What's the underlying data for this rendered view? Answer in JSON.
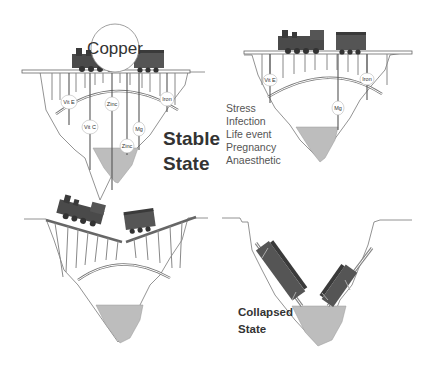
{
  "panels": {
    "stable": {
      "nutrient_bubble": "Copper",
      "pillar_labels": [
        "Vit E",
        "Zinc",
        "Iron",
        "Vit C",
        "Mg",
        "Zinc"
      ],
      "state_label_line1": "Stable",
      "state_label_line2": "State"
    },
    "stressed": {
      "pillar_labels": [
        "Vit E",
        "Iron",
        "Mg"
      ],
      "stressors": [
        "Stress",
        "Infection",
        "Life event",
        "Pregnancy",
        "Anaesthetic"
      ]
    },
    "breaking": {
      "description": "Bridge sagging and breaking, train derailing"
    },
    "collapsed": {
      "state_label_line1": "Collapsed",
      "state_label_line2": "State"
    }
  },
  "colors": {
    "water": "#bdbdbd",
    "line": "#555555",
    "train": "#4a4a4a",
    "text": "#333333"
  }
}
